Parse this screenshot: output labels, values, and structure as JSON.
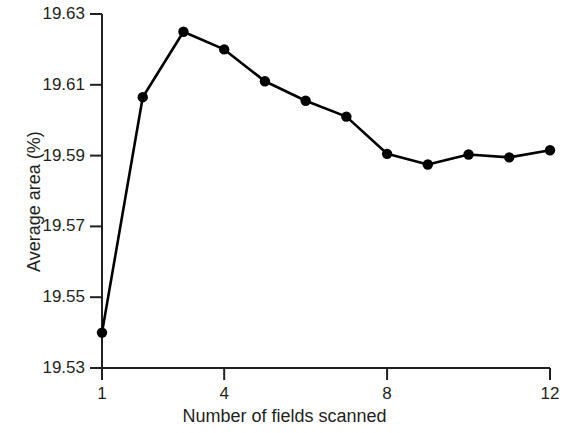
{
  "chart_data": {
    "type": "line",
    "title": "",
    "xlabel": "Number of fields scanned",
    "ylabel": "Average area (%)",
    "xlim": [
      1,
      12
    ],
    "ylim": [
      19.53,
      19.63
    ],
    "xticks": [
      1,
      4,
      8,
      12
    ],
    "xtick_labels": [
      "1",
      "4",
      "8",
      "12"
    ],
    "yticks": [
      19.53,
      19.55,
      19.57,
      19.59,
      19.61,
      19.63
    ],
    "ytick_labels": [
      "19.53",
      "19.55",
      "19.57",
      "19.59",
      "19.61",
      "19.63"
    ],
    "grid": false,
    "legend": false,
    "marker": "filled-circle",
    "line_color": "#000000",
    "marker_color": "#000000",
    "x": [
      1,
      2,
      3,
      4,
      5,
      6,
      7,
      8,
      9,
      10,
      11,
      12
    ],
    "values": [
      19.54,
      19.6065,
      19.625,
      19.62,
      19.611,
      19.6055,
      19.601,
      19.5905,
      19.5875,
      19.5903,
      19.5895,
      19.5915
    ],
    "series": [
      {
        "name": "Average area",
        "values": [
          19.54,
          19.6065,
          19.625,
          19.62,
          19.611,
          19.6055,
          19.601,
          19.5905,
          19.5875,
          19.5903,
          19.5895,
          19.5915
        ]
      }
    ],
    "annotations": []
  },
  "axes": {
    "x_title": "Number of fields scanned",
    "y_title": "Average area (%)"
  }
}
